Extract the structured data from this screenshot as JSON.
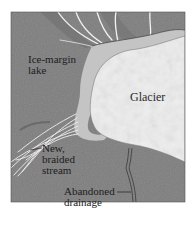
{
  "figure": {
    "type": "map-diagram",
    "colors": {
      "background": "#ffffff",
      "terrain": "#7e7e7e",
      "terrain_dark": "#6f6f6f",
      "lake": "#c4c4c4",
      "glacier": "#ededed",
      "glacier_shade": "#d9d9d9",
      "stream": "#f2f2f2",
      "abandoned_drainage": "#3a3a3a",
      "text": "#1c1c1c",
      "frame": "#555555"
    },
    "labels": {
      "lake": {
        "line1": "Ice-margin",
        "line2": "lake"
      },
      "glacier": {
        "text": "Glacier"
      },
      "braided_stream": {
        "line1": "New,",
        "line2": "braided",
        "line3": "stream"
      },
      "abandoned": {
        "line1": "Abandoned",
        "line2": "drainage"
      }
    }
  }
}
